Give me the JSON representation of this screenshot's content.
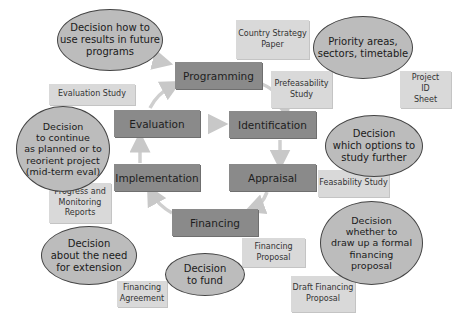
{
  "diagram": {
    "type": "project cycle",
    "colors": {
      "phase_box": "#8a8a8a",
      "document_box": "#d9d9d9",
      "decision_ellipse": "#bcbcbc",
      "arrow": "#c8c8c8"
    },
    "phases": [
      {
        "id": "programming",
        "label": "Programming"
      },
      {
        "id": "identification",
        "label": "Identification"
      },
      {
        "id": "appraisal",
        "label": "Appraisal"
      },
      {
        "id": "financing",
        "label": "Financing"
      },
      {
        "id": "implementation",
        "label": "Implementation"
      },
      {
        "id": "evaluation",
        "label": "Evaluation"
      }
    ],
    "documents": [
      {
        "id": "country-strategy-paper",
        "label": "Country Strategy\nPaper"
      },
      {
        "id": "prefeasability-study",
        "label": "Prefeasability\nStudy"
      },
      {
        "id": "project-id-sheet",
        "label": "Project\nID\nSheet"
      },
      {
        "id": "evaluation-study",
        "label": "Evaluation Study"
      },
      {
        "id": "progress-monitoring-reports",
        "label": "Progress and\nMonitoring\nReports"
      },
      {
        "id": "feasability-study",
        "label": "Feasability Study"
      },
      {
        "id": "financing-proposal",
        "label": "Financing\nProposal"
      },
      {
        "id": "draft-financing-proposal",
        "label": "Draft Financing\nProposal"
      },
      {
        "id": "financing-agreement",
        "label": "Financing\nAgreement"
      }
    ],
    "decisions": [
      {
        "id": "decision-future-programs",
        "label": "Decision how to\nuse results in future\nprograms"
      },
      {
        "id": "decision-priority-areas",
        "label": "Priority areas,\nsectors, timetable"
      },
      {
        "id": "decision-options",
        "label": "Decision\nwhich options to\nstudy further"
      },
      {
        "id": "decision-continue",
        "label": "Decision\nto continue\nas planned or to\nreorient project\n(mid-term eval)"
      },
      {
        "id": "decision-extension",
        "label": "Decision\nabout the need\nfor extension"
      },
      {
        "id": "decision-fund",
        "label": "Decision\nto fund"
      },
      {
        "id": "decision-formal-proposal",
        "label": "Decision\nwhether to\ndraw up a formal\nfinancing\nproposal"
      }
    ],
    "flow": [
      "Programming",
      "Identification",
      "Appraisal",
      "Financing",
      "Implementation",
      "Evaluation",
      "Programming"
    ]
  }
}
